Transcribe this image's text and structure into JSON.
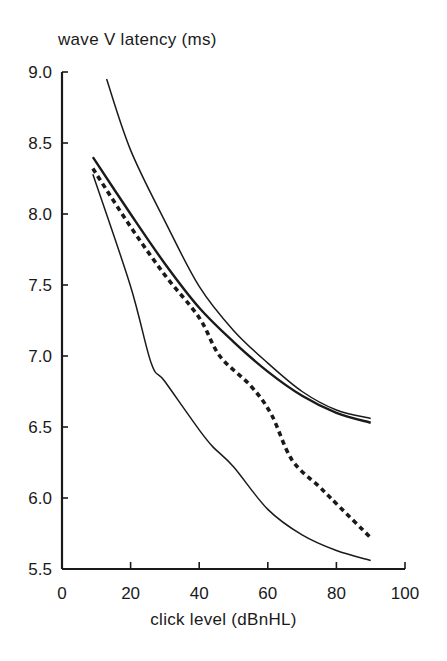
{
  "chart_data": {
    "type": "line",
    "title": "",
    "ylabel": "wave V latency (ms)",
    "xlabel": "click level (dBnHL)",
    "xlim": [
      0,
      100
    ],
    "ylim": [
      5.5,
      9.0
    ],
    "xticks": [
      0,
      20,
      40,
      60,
      80,
      100
    ],
    "xtick_labels": [
      "0",
      "20",
      "40",
      "60",
      "80",
      "100"
    ],
    "yticks": [
      5.5,
      6.0,
      6.5,
      7.0,
      7.5,
      8.0,
      8.5,
      9.0
    ],
    "ytick_labels": [
      "5.5",
      "6.0",
      "6.5",
      "7.0",
      "7.5",
      "8.0",
      "8.5",
      "9.0"
    ],
    "grid": false,
    "legend": null,
    "series": [
      {
        "name": "upper bound",
        "style": "thin-solid",
        "x": [
          13,
          20,
          30,
          40,
          50,
          60,
          70,
          80,
          90
        ],
        "y": [
          8.95,
          8.45,
          7.95,
          7.49,
          7.18,
          6.95,
          6.75,
          6.62,
          6.56
        ]
      },
      {
        "name": "mean",
        "style": "solid",
        "x": [
          9,
          20,
          30,
          40,
          50,
          60,
          70,
          80,
          90
        ],
        "y": [
          8.4,
          8.0,
          7.65,
          7.34,
          7.1,
          6.89,
          6.72,
          6.6,
          6.53
        ]
      },
      {
        "name": "dashed curve",
        "style": "dashed",
        "x": [
          9,
          20,
          30,
          40,
          46,
          55,
          61,
          67,
          75,
          80,
          90
        ],
        "y": [
          8.32,
          7.91,
          7.57,
          7.27,
          7.0,
          6.79,
          6.59,
          6.27,
          6.08,
          5.96,
          5.72
        ]
      },
      {
        "name": "lower bound",
        "style": "thin-solid",
        "x": [
          9,
          20,
          26,
          30,
          40,
          44,
          50,
          60,
          70,
          80,
          90
        ],
        "y": [
          8.28,
          7.49,
          6.95,
          6.82,
          6.48,
          6.36,
          6.22,
          5.92,
          5.74,
          5.63,
          5.56
        ]
      }
    ]
  },
  "labels": {
    "ylabel": "wave V latency (ms)",
    "xlabel": "click level (dBnHL)"
  }
}
